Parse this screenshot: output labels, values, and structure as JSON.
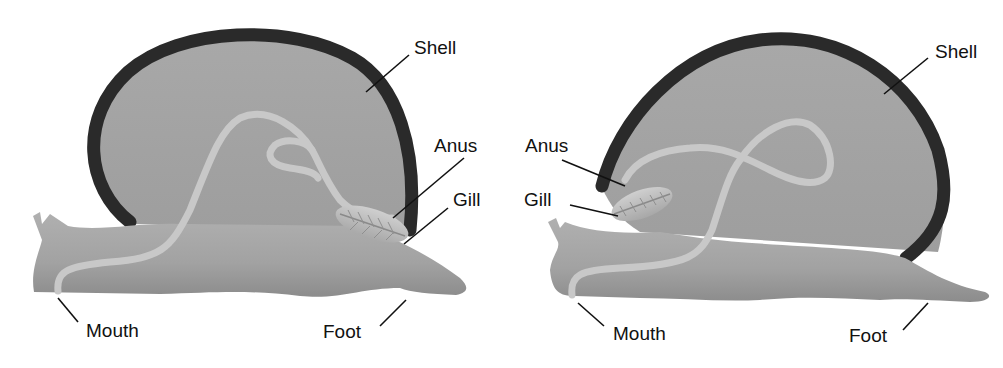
{
  "diagram": {
    "colors": {
      "background": "#ffffff",
      "body": "#9a9a9a",
      "body_light": "#b4b4b4",
      "shell_rim": "#2a2a2a",
      "gut": "#c4c4c4",
      "gill": "#bdbdbd",
      "leader_line": "#111111"
    },
    "panels": [
      {
        "id": "left",
        "description": "Untwisted snail",
        "labels": {
          "shell": "Shell",
          "anus": "Anus",
          "gill": "Gill",
          "mouth": "Mouth",
          "foot": "Foot"
        }
      },
      {
        "id": "right",
        "description": "Twisted snail (after torsion)",
        "labels": {
          "shell": "Shell",
          "anus": "Anus",
          "gill": "Gill",
          "mouth": "Mouth",
          "foot": "Foot"
        }
      }
    ]
  }
}
